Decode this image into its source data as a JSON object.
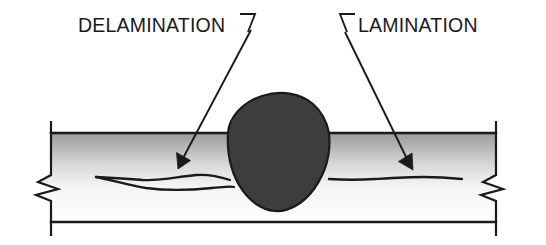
{
  "figure": {
    "type": "technical-cross-section-diagram",
    "background_color": "#ffffff",
    "line_color": "#1a1a1a"
  },
  "labels": {
    "delamination": {
      "text": "DELAMINATION",
      "x": 78,
      "y": 32,
      "anchor": "start"
    },
    "lamination": {
      "text": "LAMINATION",
      "x": 358,
      "y": 32,
      "anchor": "start"
    }
  },
  "leaders": {
    "delamination": {
      "hook_path": "M 240 14 L 255 14 L 248 32",
      "line_path": "M 251 30 L 181 162",
      "arrow_path": "M 178 169 L 176.5 152.5 L 190.5 160.5 Z",
      "arrow_tip": [
        178,
        169
      ]
    },
    "lamination": {
      "hook_path": "M 355 14 L 340 14 L 347 32",
      "line_path": "M 345 32 L 409 163",
      "arrow_path": "M 413 170 L 398.5 161.5 L 412 153 Z",
      "arrow_tip": [
        413,
        170
      ]
    }
  },
  "plate": {
    "top_line_y": 133,
    "bottom_line_y": 222,
    "left_x": 50,
    "right_x": 497,
    "gradient": {
      "top_color": "#9a9a9a",
      "mid_color": "#ffffff",
      "bottom_color": "#ffffff"
    },
    "end_caps": {
      "left_top": "M 51 121 L 51 133",
      "left_bottom": "M 51 222 L 51 236",
      "right_top": "M 496 121 L 496 133",
      "right_bottom": "M 496 222 L 496 236"
    },
    "break_symbols": {
      "left": "M 51 133 L 51 175 L 38 182 L 58 189 L 36 195 L 51 201 L 51 222",
      "right": "M 496 133 L 496 175 L 483 182 L 503 189 L 481 195 L 496 201 L 496 222"
    }
  },
  "weld_nugget": {
    "fill_color": "#3d3d3d",
    "stroke_color": "#1a1a1a",
    "path": "M 228 133 C 229 117 243 102 262 96 C 281 90 300 93 313 104 C 322 112 327 122 329 133 C 331 152 326 172 314 189 C 303 204 288 212 275 211 C 261 210 248 200 239 185 C 230 169 227 150 228 133 Z"
  },
  "discontinuities": {
    "delamination": {
      "name": "delamination-crack",
      "upper_path": "M 96 177 C 118 178 132 179 143 180 C 160 181 176 177 196 175 C 208 174 218 176 230 180",
      "lower_path": "M 96 177 C 112 180 128 185 146 188 C 168 191 192 190 212 188 C 224 187 231 186 234 187"
    },
    "lamination": {
      "name": "lamination-line",
      "path": "M 329 179 C 345 180 360 180 375 179 C 392 178 408 177 424 177 C 440 177 452 178 462 179"
    }
  }
}
